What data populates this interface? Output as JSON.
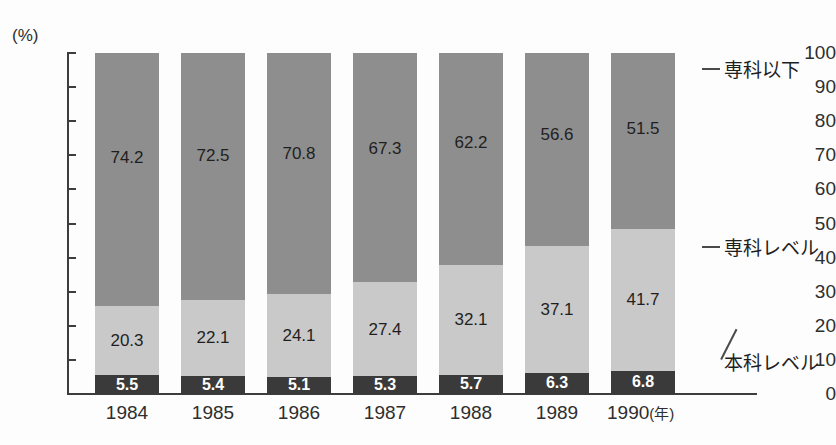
{
  "chart_data": {
    "type": "bar",
    "subtype": "stacked-percentage",
    "title": "",
    "xlabel": "年",
    "ylabel": "",
    "yunit": "(%)",
    "ylim": [
      0,
      100
    ],
    "ytick_step": 10,
    "yticks": [
      100,
      90,
      80,
      70,
      60,
      50,
      40,
      30,
      20,
      10,
      0
    ],
    "grid": false,
    "legend_position": "right-callout",
    "categories": [
      "1984",
      "1985",
      "1986",
      "1987",
      "1988",
      "1989",
      "1990"
    ],
    "series": [
      {
        "name": "専科以下",
        "color": "#8e8e8e",
        "values": [
          74.2,
          72.5,
          70.8,
          67.3,
          62.2,
          56.6,
          51.5
        ]
      },
      {
        "name": "専科レベル",
        "color": "#c9c9c9",
        "values": [
          20.3,
          22.1,
          24.1,
          27.4,
          32.1,
          37.1,
          41.7
        ]
      },
      {
        "name": "本科レベル",
        "color": "#3a3a3a",
        "values": [
          5.5,
          5.4,
          5.1,
          5.3,
          5.7,
          6.3,
          6.8
        ]
      }
    ],
    "stack_order_top_to_bottom": [
      "専科以下",
      "専科レベル",
      "本科レベル"
    ]
  },
  "axis": {
    "unit_label": "(%)",
    "ticks": [
      "100",
      "90",
      "80",
      "70",
      "60",
      "50",
      "40",
      "30",
      "20",
      "10",
      "0"
    ]
  },
  "xaxis": {
    "labels": [
      "1984",
      "1985",
      "1986",
      "1987",
      "1988",
      "1989",
      "1990"
    ],
    "unit": "(年)"
  },
  "legend": {
    "items": [
      {
        "label": "専科以下",
        "color": "#8e8e8e"
      },
      {
        "label": "専科レベル",
        "color": "#c9c9c9"
      },
      {
        "label": "本科レベル",
        "color": "#3a3a3a"
      }
    ]
  },
  "bar_labels": {
    "top": [
      "74.2",
      "72.5",
      "70.8",
      "67.3",
      "62.2",
      "56.6",
      "51.5"
    ],
    "mid": [
      "20.3",
      "22.1",
      "24.1",
      "27.4",
      "32.1",
      "37.1",
      "41.7"
    ],
    "bottom": [
      "5.5",
      "5.4",
      "5.1",
      "5.3",
      "5.7",
      "6.3",
      "6.8"
    ]
  }
}
